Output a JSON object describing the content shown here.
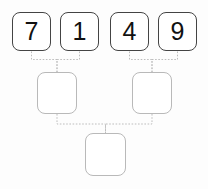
{
  "diagram": {
    "type": "binary-merge-tree",
    "background_color": "#fdfdfd",
    "leaf_border_color": "#444444",
    "empty_border_color": "#b9b9b9",
    "connector_color": "#bdbdbd",
    "connector_style": "dotted"
  },
  "levels": [
    {
      "name": "leaf-row",
      "nodes": [
        {
          "id": "leaf-1",
          "value": "7",
          "filled": true,
          "x": 12,
          "y": 12,
          "w": 39,
          "h": 39
        },
        {
          "id": "leaf-2",
          "value": "1",
          "filled": true,
          "x": 60,
          "y": 12,
          "w": 39,
          "h": 39
        },
        {
          "id": "leaf-3",
          "value": "4",
          "filled": true,
          "x": 110,
          "y": 12,
          "w": 39,
          "h": 39
        },
        {
          "id": "leaf-4",
          "value": "9",
          "filled": true,
          "x": 158,
          "y": 12,
          "w": 39,
          "h": 39
        }
      ]
    },
    {
      "name": "merge-row",
      "nodes": [
        {
          "id": "merge-left",
          "value": "",
          "filled": false,
          "x": 37,
          "y": 72,
          "w": 40,
          "h": 42
        },
        {
          "id": "merge-right",
          "value": "",
          "filled": false,
          "x": 132,
          "y": 72,
          "w": 40,
          "h": 42
        }
      ]
    },
    {
      "name": "root-row",
      "nodes": [
        {
          "id": "root",
          "value": "",
          "filled": false,
          "x": 85,
          "y": 133,
          "w": 41,
          "h": 43
        }
      ]
    }
  ],
  "connectors": [
    {
      "id": "conn-leaf1-mergeleft",
      "from": "leaf-1",
      "to": "merge-left"
    },
    {
      "id": "conn-leaf2-mergeleft",
      "from": "leaf-2",
      "to": "merge-left"
    },
    {
      "id": "conn-leaf3-mergeright",
      "from": "leaf-3",
      "to": "merge-right"
    },
    {
      "id": "conn-leaf4-mergeright",
      "from": "leaf-4",
      "to": "merge-right"
    },
    {
      "id": "conn-mergeleft-root",
      "from": "merge-left",
      "to": "root"
    },
    {
      "id": "conn-mergeright-root",
      "from": "merge-right",
      "to": "root"
    }
  ]
}
